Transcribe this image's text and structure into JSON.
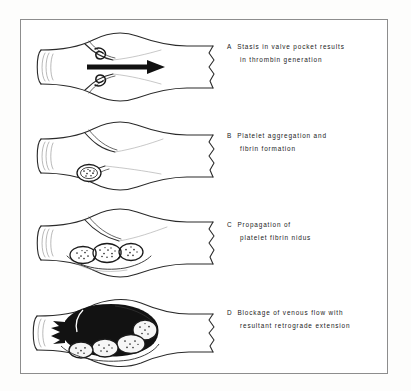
{
  "figure": {
    "border_color": "#8d8d8d",
    "background_color": "#ffffff",
    "ink_color": "#1a1a1a"
  },
  "panels": [
    {
      "letter": "A",
      "line1": "Stasis in valve pocket results",
      "line2": "in thrombin generation",
      "art": "vein-valve-with-flow-arrow-and-eddies"
    },
    {
      "letter": "B",
      "line1": "Platelet aggregation and",
      "line2": "fibrin formation",
      "art": "vein-valve-with-small-platelet-nidus"
    },
    {
      "letter": "C",
      "line1": "Propagation of",
      "line2": "platelet fibrin  nidus",
      "art": "vein-valve-with-three-thrombus-lobules"
    },
    {
      "letter": "D",
      "line1": "Blockage of venous flow with",
      "line2": "resultant retrograde extension",
      "art": "vein-occluded-by-black-thrombus-with-retrograde-fingers"
    }
  ]
}
